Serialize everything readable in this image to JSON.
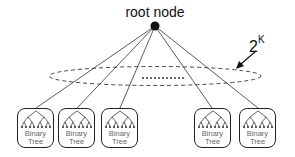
{
  "diagram": {
    "root_label": "root node",
    "count_label": {
      "base": "2",
      "exponent": "K"
    },
    "ellipsis": "...........",
    "tree_boxes": [
      {
        "line1": "Binary",
        "line2": "Tree"
      },
      {
        "line1": "Binary",
        "line2": "Tree"
      },
      {
        "line1": "Binary",
        "line2": "Tree"
      },
      {
        "line1": "Binary",
        "line2": "Tree"
      },
      {
        "line1": "Binary",
        "line2": "Tree"
      }
    ],
    "colors": {
      "stroke": "#222222",
      "text": "#111111",
      "tree_text": "#666666"
    }
  }
}
